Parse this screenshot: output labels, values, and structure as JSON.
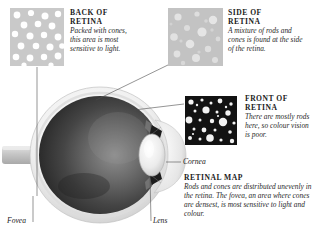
{
  "figure": {
    "background_color": "#ffffff"
  },
  "callouts": [
    {
      "id": "back-of-retina",
      "heading": "BACK OF\nRETINA",
      "heading_line1": "BACK OF",
      "heading_line2": "RETINA",
      "body": "Packed with cones, this area is most sensitive to light.",
      "swatch": {
        "name": "back-of-retina-swatch",
        "background_color": "#c9c9c9",
        "dot_color": "#ffffff",
        "description": "dense uniform large cones"
      }
    },
    {
      "id": "side-of-retina",
      "heading_line1": "SIDE OF",
      "heading_line2": "RETINA",
      "body": "A mixture of rods and cones is found at the side of the retina.",
      "swatch": {
        "name": "side-of-retina-swatch",
        "background_color": "#c3c3c3",
        "dot_color": "#e8e8e8",
        "description": "soft mixture of rods and cones"
      }
    },
    {
      "id": "front-of-retina",
      "heading_line1": "FRONT OF",
      "heading_line2": "RETINA",
      "body": "There are mostly rods here, so colour vision is poor.",
      "swatch": {
        "name": "front-of-retina-swatch",
        "background_color": "#121212",
        "dot_color": "#f2f2f2",
        "description": "mostly small rods on dark ground"
      }
    },
    {
      "id": "retinal-map",
      "heading_line1": "RETINAL MAP",
      "heading_line2": "",
      "body": "Rods and cones are distributed unevenly in the retina. The fovea, an area where cones are densest, is most sensitive to light and colour."
    }
  ],
  "part_labels": [
    {
      "id": "cornea",
      "text": "Cornea"
    },
    {
      "id": "fovea",
      "text": "Fovea"
    },
    {
      "id": "lens",
      "text": "Lens"
    }
  ],
  "eye_diagram": {
    "name": "eye-cross-section",
    "colors": {
      "sclera": "#f4f4f4",
      "sclera_shadow": "#cfcfcf",
      "vitreous_dark": "#2e2e2e",
      "vitreous_mid": "#565656",
      "vitreous_light": "#8d8d8d",
      "lens": "#ededed",
      "optic_nerve": "#cdcdcd",
      "leader_line": "#5a5a5a"
    }
  }
}
